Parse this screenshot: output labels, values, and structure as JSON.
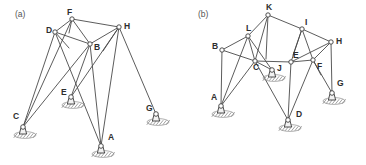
{
  "figure": {
    "background_color": "#ffffff",
    "line_color": "#4a4a4a",
    "joint_fill": "#ffffff",
    "support_fill": "#f2f2f2",
    "hatch_color": "#8a8a8a",
    "label_color": "#2e2e2e",
    "width": 366,
    "height": 165
  },
  "panels": [
    {
      "id": "panel-a",
      "label": "(a)",
      "label_pos": {
        "x": 15,
        "y": 17
      },
      "nodes": [
        {
          "name": "F",
          "x": 72,
          "y": 19,
          "type": "joint",
          "label_dx": -5,
          "label_dy": -4
        },
        {
          "name": "H",
          "x": 119,
          "y": 27,
          "type": "joint",
          "label_dx": 5,
          "label_dy": 2
        },
        {
          "name": "D",
          "x": 55,
          "y": 32,
          "type": "joint",
          "label_dx": -9,
          "label_dy": 1
        },
        {
          "name": "B",
          "x": 90,
          "y": 44,
          "type": "joint",
          "label_dx": 4,
          "label_dy": 6
        },
        {
          "name": "C",
          "x": 23,
          "y": 127,
          "type": "support",
          "label_dx": -10,
          "label_dy": -8
        },
        {
          "name": "E",
          "x": 71,
          "y": 97,
          "type": "support",
          "label_dx": -10,
          "label_dy": -2
        },
        {
          "name": "A",
          "x": 101,
          "y": 146,
          "type": "support",
          "label_dx": 7,
          "label_dy": -6
        },
        {
          "name": "G",
          "x": 156,
          "y": 114,
          "type": "support",
          "label_dx": -10,
          "label_dy": -3
        }
      ],
      "members": [
        [
          "F",
          "H"
        ],
        [
          "F",
          "D"
        ],
        [
          "F",
          "B"
        ],
        [
          "D",
          "B"
        ],
        [
          "B",
          "H"
        ],
        [
          "D",
          "C"
        ],
        [
          "D",
          "A"
        ],
        [
          "B",
          "C"
        ],
        [
          "B",
          "A"
        ],
        [
          "B",
          "E"
        ],
        [
          "H",
          "A"
        ],
        [
          "H",
          "G"
        ],
        [
          "H",
          "E"
        ],
        [
          "F",
          "C"
        ]
      ],
      "stubs": [
        {
          "from": "F",
          "dx": -3,
          "dy": 14
        },
        {
          "from": "D",
          "dx": 14,
          "dy": 16
        },
        {
          "from": "H",
          "dx": -16,
          "dy": 24
        }
      ]
    },
    {
      "id": "panel-b",
      "label": "(b)",
      "label_pos": {
        "x": 198,
        "y": 17
      },
      "nodes": [
        {
          "name": "K",
          "x": 268,
          "y": 15,
          "type": "joint",
          "label_dx": -2,
          "label_dy": -5
        },
        {
          "name": "I",
          "x": 302,
          "y": 29,
          "type": "joint",
          "label_dx": 3,
          "label_dy": -4
        },
        {
          "name": "L",
          "x": 248,
          "y": 36,
          "type": "joint",
          "label_dx": -2,
          "label_dy": -5
        },
        {
          "name": "H",
          "x": 331,
          "y": 42,
          "type": "joint",
          "label_dx": 5,
          "label_dy": 2
        },
        {
          "name": "B",
          "x": 222,
          "y": 50,
          "type": "joint",
          "label_dx": -10,
          "label_dy": -1
        },
        {
          "name": "C",
          "x": 255,
          "y": 61,
          "type": "joint",
          "label_dx": -2,
          "label_dy": 9
        },
        {
          "name": "E",
          "x": 291,
          "y": 62,
          "type": "joint",
          "label_dx": 2,
          "label_dy": -4
        },
        {
          "name": "F",
          "x": 313,
          "y": 60,
          "type": "joint",
          "label_dx": 4,
          "label_dy": 9
        },
        {
          "name": "J",
          "x": 272,
          "y": 70,
          "type": "support",
          "label_dx": 5,
          "label_dy": 1
        },
        {
          "name": "A",
          "x": 221,
          "y": 106,
          "type": "support",
          "label_dx": -10,
          "label_dy": -6
        },
        {
          "name": "D",
          "x": 288,
          "y": 120,
          "type": "support",
          "label_dx": 8,
          "label_dy": -3
        },
        {
          "name": "G",
          "x": 332,
          "y": 93,
          "type": "support",
          "label_dx": 5,
          "label_dy": -7
        }
      ],
      "members": [
        [
          "K",
          "L"
        ],
        [
          "K",
          "I"
        ],
        [
          "K",
          "C"
        ],
        [
          "L",
          "B"
        ],
        [
          "L",
          "C"
        ],
        [
          "L",
          "A"
        ],
        [
          "L",
          "J"
        ],
        [
          "I",
          "H"
        ],
        [
          "I",
          "E"
        ],
        [
          "I",
          "F"
        ],
        [
          "B",
          "C"
        ],
        [
          "B",
          "A"
        ],
        [
          "C",
          "E"
        ],
        [
          "C",
          "A"
        ],
        [
          "C",
          "D"
        ],
        [
          "C",
          "J"
        ],
        [
          "E",
          "F"
        ],
        [
          "E",
          "D"
        ],
        [
          "F",
          "H"
        ],
        [
          "F",
          "D"
        ],
        [
          "F",
          "G"
        ],
        [
          "H",
          "G"
        ],
        [
          "E",
          "H"
        ]
      ],
      "stubs": [
        {
          "from": "K",
          "dx": -2,
          "dy": 44
        },
        {
          "from": "I",
          "dx": -9,
          "dy": 26
        },
        {
          "from": "F",
          "dx": 8,
          "dy": 15
        }
      ]
    }
  ]
}
